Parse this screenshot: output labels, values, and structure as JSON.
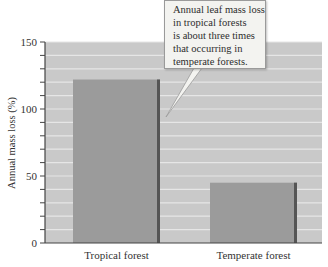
{
  "chart_data": {
    "type": "bar",
    "title": "",
    "xlabel": "",
    "ylabel": "Annual mass loss (%)",
    "categories": [
      "Tropical forest",
      "Temperate forest"
    ],
    "values": [
      122,
      45
    ],
    "ylim": [
      0,
      150
    ],
    "yticks": [
      0,
      50,
      100,
      150
    ],
    "minor_tick_step": 10,
    "grid": true,
    "legend": null,
    "annotations": [
      {
        "text_lines": [
          "Annual leaf mass loss",
          "in tropical forests",
          "is about three times",
          "that occurring in",
          "temperate forests."
        ],
        "points_to": "Tropical forest"
      }
    ]
  },
  "colors": {
    "plot_background": "#c9c9c9",
    "gridline": "#e6e6e6",
    "bar_fill": "#9b9b9b",
    "bar_edge": "#555555",
    "axis": "#444444"
  }
}
